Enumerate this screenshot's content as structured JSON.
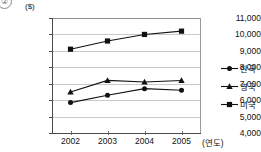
{
  "figure": {
    "corner_mark": "②",
    "title_clipped": "",
    "unit_label": "($)",
    "xaxis_unit": "(연도)"
  },
  "legend": {
    "position": "right",
    "items": [
      {
        "label": "한국",
        "marker": "circle-marker-icon"
      },
      {
        "label": "영국",
        "marker": "triangle-marker-icon"
      },
      {
        "label": "미국",
        "marker": "square-marker-icon"
      }
    ]
  },
  "chart_data": {
    "type": "line",
    "title": "",
    "subtitle": "",
    "xlabel": "(연도)",
    "ylabel": "($)",
    "x": [
      "2002",
      "2003",
      "2004",
      "2005"
    ],
    "categories": [
      "2002",
      "2003",
      "2004",
      "2005"
    ],
    "ylim": [
      4000,
      11000
    ],
    "yticks": [
      4000,
      5000,
      6000,
      7000,
      8000,
      9000,
      10000,
      11000
    ],
    "ytick_labels": [
      "4,000",
      "5,000",
      "6,000",
      "7,000",
      "8,000",
      "9,000",
      "10,000",
      "11,000"
    ],
    "xtick_labels": [
      "2002",
      "2003",
      "2004",
      "2005"
    ],
    "grid": "horizontal",
    "legend_position": "right",
    "series": [
      {
        "name": "한국",
        "marker": "circle",
        "values": [
          5850,
          6300,
          6700,
          6600
        ]
      },
      {
        "name": "영국",
        "marker": "triangle",
        "values": [
          6500,
          7200,
          7100,
          7200
        ]
      },
      {
        "name": "미국",
        "marker": "square",
        "values": [
          9100,
          9600,
          10000,
          10200
        ]
      }
    ]
  }
}
